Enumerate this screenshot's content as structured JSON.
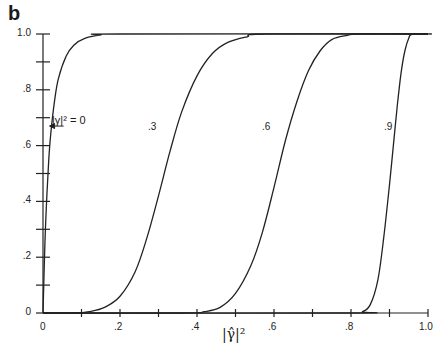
{
  "panel_label": "b",
  "chart_data": {
    "type": "line",
    "title": "",
    "xlabel": "|γ̂|²",
    "ylabel": "",
    "xlim": [
      0,
      1.0
    ],
    "ylim": [
      0,
      1.0
    ],
    "grid": false,
    "legend_position": "inline",
    "x_ticks": [
      "0",
      ".2",
      ".4",
      ".6",
      ".8",
      "1.0"
    ],
    "y_ticks": [
      "0",
      ".2",
      ".4",
      ".6",
      ".8",
      "1.0"
    ],
    "series": [
      {
        "name": "|γ|² = 0",
        "label": "|γ|² = 0",
        "points": [
          [
            0,
            0
          ],
          [
            0.005,
            0.25
          ],
          [
            0.01,
            0.42
          ],
          [
            0.015,
            0.55
          ],
          [
            0.02,
            0.64
          ],
          [
            0.03,
            0.76
          ],
          [
            0.04,
            0.84
          ],
          [
            0.06,
            0.92
          ],
          [
            0.08,
            0.96
          ],
          [
            0.11,
            0.985
          ],
          [
            0.15,
            0.997
          ],
          [
            0.2,
            1.0
          ],
          [
            1.0,
            1.0
          ]
        ]
      },
      {
        "name": "|γ|² = .3",
        "label": ".3",
        "points": [
          [
            0,
            0
          ],
          [
            0.08,
            0.0
          ],
          [
            0.12,
            0.005
          ],
          [
            0.16,
            0.02
          ],
          [
            0.2,
            0.06
          ],
          [
            0.24,
            0.15
          ],
          [
            0.27,
            0.27
          ],
          [
            0.3,
            0.42
          ],
          [
            0.33,
            0.58
          ],
          [
            0.36,
            0.72
          ],
          [
            0.4,
            0.85
          ],
          [
            0.44,
            0.93
          ],
          [
            0.48,
            0.97
          ],
          [
            0.53,
            0.99
          ],
          [
            0.58,
            1.0
          ],
          [
            1.0,
            1.0
          ]
        ]
      },
      {
        "name": "|γ|² = .6",
        "label": ".6",
        "points": [
          [
            0,
            0
          ],
          [
            0.36,
            0.0
          ],
          [
            0.42,
            0.005
          ],
          [
            0.46,
            0.02
          ],
          [
            0.5,
            0.07
          ],
          [
            0.54,
            0.17
          ],
          [
            0.57,
            0.29
          ],
          [
            0.6,
            0.45
          ],
          [
            0.63,
            0.62
          ],
          [
            0.66,
            0.76
          ],
          [
            0.69,
            0.87
          ],
          [
            0.72,
            0.94
          ],
          [
            0.75,
            0.98
          ],
          [
            0.79,
            0.995
          ],
          [
            0.82,
            1.0
          ],
          [
            1.0,
            1.0
          ]
        ]
      },
      {
        "name": "|γ|² = .9",
        "label": ".9",
        "points": [
          [
            0,
            0
          ],
          [
            0.8,
            0.0
          ],
          [
            0.83,
            0.005
          ],
          [
            0.85,
            0.03
          ],
          [
            0.87,
            0.12
          ],
          [
            0.885,
            0.27
          ],
          [
            0.9,
            0.46
          ],
          [
            0.91,
            0.6
          ],
          [
            0.92,
            0.74
          ],
          [
            0.93,
            0.86
          ],
          [
            0.94,
            0.94
          ],
          [
            0.95,
            0.985
          ],
          [
            0.96,
            1.0
          ],
          [
            1.01,
            1.0
          ]
        ]
      }
    ],
    "annotations": [
      {
        "text": "|γ|² = 0",
        "arrow_to": [
          0.012,
          0.67
        ]
      },
      {
        "text": ".3",
        "at": [
          0.27,
          0.67
        ]
      },
      {
        "text": ".6",
        "at": [
          0.57,
          0.67
        ]
      },
      {
        "text": ".9",
        "at": [
          0.87,
          0.67
        ]
      }
    ]
  }
}
